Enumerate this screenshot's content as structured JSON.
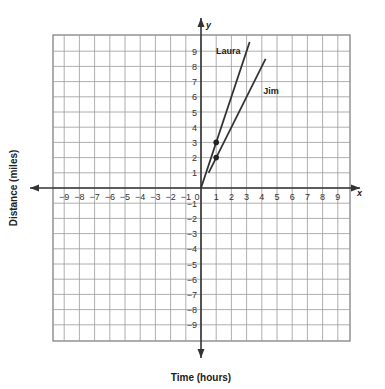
{
  "chart_data": {
    "type": "line",
    "title": "",
    "xlabel": "Time (hours)",
    "ylabel": "Distance (miles)",
    "x_axis_letter": "x",
    "y_axis_letter": "y",
    "xlim": [
      -10,
      10
    ],
    "ylim": [
      -10,
      10
    ],
    "grid": true,
    "x_ticks": [
      -9,
      -8,
      -7,
      -6,
      -5,
      -4,
      -3,
      -2,
      -1,
      0,
      1,
      2,
      3,
      4,
      5,
      6,
      7,
      8,
      9
    ],
    "y_ticks": [
      -9,
      -8,
      -7,
      -6,
      -5,
      -4,
      -3,
      -2,
      -1,
      1,
      2,
      3,
      4,
      5,
      6,
      7,
      8,
      9
    ],
    "series": [
      {
        "name": "Laura",
        "points": [
          [
            0,
            0
          ],
          [
            1,
            3
          ],
          [
            3.2,
            9.6
          ]
        ],
        "marked_point": [
          1,
          3
        ],
        "slope": 3,
        "color": "#333333"
      },
      {
        "name": "Jim",
        "points": [
          [
            0.5,
            1
          ],
          [
            1,
            2
          ],
          [
            4.25,
            8.5
          ]
        ],
        "marked_point": [
          1,
          2
        ],
        "slope": 2,
        "color": "#333333"
      }
    ],
    "annotations": [
      {
        "text": "Laura",
        "x": 1.8,
        "y": 8.8
      },
      {
        "text": "Jim",
        "x": 4.6,
        "y": 6.2
      }
    ]
  }
}
